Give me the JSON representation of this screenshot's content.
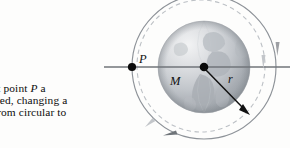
{
  "figure": {
    "caption": {
      "number": "7",
      "lines": [
        "7  At point P a",
        "is fired, changing a",
        "bit from circular to"
      ],
      "line1_prefix": "7",
      "line1_rest": "At point",
      "line1_italic": "P",
      "line1_suffix": "a",
      "line2": "is fired, changing a",
      "line3": "bit from circular to",
      "tail": "."
    },
    "labels": {
      "point_p": "P",
      "mass": "M",
      "radius": "r"
    },
    "colors": {
      "solid_orbit": "#8a8f96",
      "dashed_orbit": "#b8bcc2",
      "axis_line": "#6f7479",
      "radius_arrow": "#111111",
      "point_dot": "#0a0a0a",
      "globe_light": "#e9eaec",
      "globe_mid": "#c9ccd0",
      "globe_dark": "#9aa0a6",
      "continent": "#b0b5ba",
      "text": "#0d0d0d"
    },
    "geometry": {
      "center_x": 204,
      "center_y": 67,
      "globe_radius": 46,
      "solid_orbit_radius": 72,
      "dashed_orbit_rx": 64,
      "dashed_orbit_ry": 64,
      "point_p_x": 132,
      "point_p_y": 67,
      "radius_tip_x": 249,
      "radius_tip_y": 114
    },
    "arrow_count": 4
  }
}
